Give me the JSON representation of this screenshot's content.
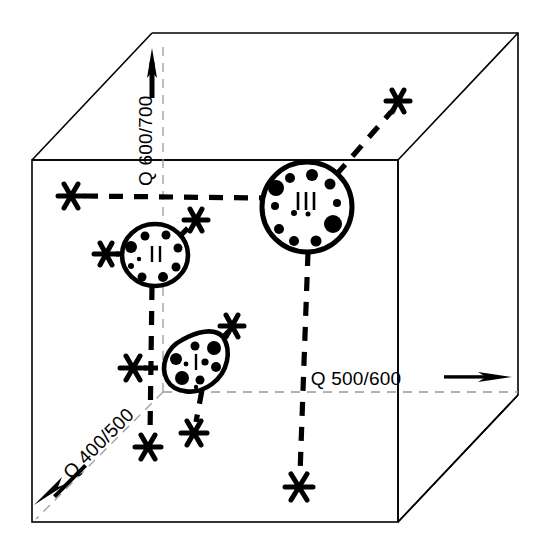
{
  "figure": {
    "background_color": "#ffffff",
    "line_color": "#000000",
    "width": 548,
    "height": 545
  },
  "axes": [
    {
      "id": "axis-q500-600",
      "label": "Q 500/600",
      "direction": "right",
      "arrow": true,
      "orientation": "horizontal"
    },
    {
      "id": "axis-q600-700",
      "label": "Q 600/700",
      "direction": "up",
      "arrow": true,
      "orientation": "vertical-rotated"
    },
    {
      "id": "axis-q400-500",
      "label": "Q 400/500",
      "direction": "lower-left",
      "arrow": true,
      "orientation": "diagonal"
    }
  ],
  "cells": [
    {
      "id": "cell-i",
      "label": "I",
      "shape": "teardrop",
      "size": "small",
      "center_x": 205,
      "center_y": 358,
      "dot_count": 9
    },
    {
      "id": "cell-ii",
      "label": "II",
      "shape": "oval",
      "size": "medium",
      "center_x": 155,
      "center_y": 255,
      "dot_count": 9
    },
    {
      "id": "cell-iii",
      "label": "III",
      "shape": "circle",
      "size": "large",
      "center_x": 307,
      "center_y": 207,
      "dot_count": 12
    }
  ],
  "markers": [
    {
      "id": "marker-1",
      "glyph": "asterisk",
      "x": 71,
      "y": 196
    },
    {
      "id": "marker-2",
      "glyph": "asterisk",
      "x": 106,
      "y": 254
    },
    {
      "id": "marker-3",
      "glyph": "asterisk",
      "x": 196,
      "y": 220
    },
    {
      "id": "marker-4",
      "glyph": "asterisk",
      "x": 232,
      "y": 326
    },
    {
      "id": "marker-5",
      "glyph": "asterisk",
      "x": 398,
      "y": 101
    },
    {
      "id": "marker-6",
      "glyph": "asterisk",
      "x": 133,
      "y": 368
    },
    {
      "id": "marker-7",
      "glyph": "asterisk",
      "x": 148,
      "y": 447
    },
    {
      "id": "marker-8",
      "glyph": "asterisk",
      "x": 194,
      "y": 433
    },
    {
      "id": "marker-9",
      "glyph": "asterisk",
      "x": 299,
      "y": 487
    }
  ]
}
